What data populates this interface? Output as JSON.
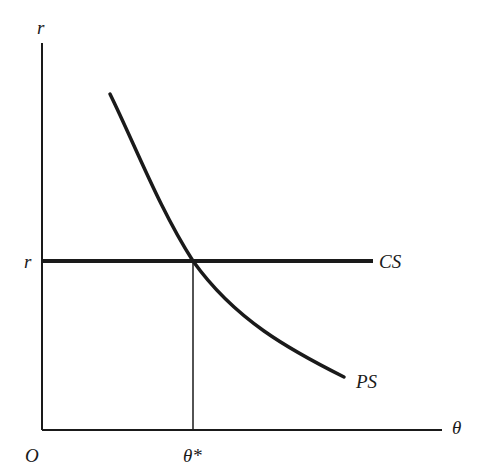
{
  "figure": {
    "type": "economics-diagram",
    "colors": {
      "ink": "#1a1a1a",
      "background": "#ffffff"
    },
    "axes": {
      "y_label": "r",
      "x_label": "θ",
      "origin_label": "O"
    },
    "levels": {
      "r_label": "r",
      "theta_star_label": "θ*"
    },
    "curves": [
      {
        "name": "CS",
        "label": "CS",
        "shape": "horizontal line at r"
      },
      {
        "name": "PS",
        "label": "PS",
        "shape": "downward-sloping convex curve"
      }
    ],
    "intersection": {
      "x_label": "θ*",
      "y_label": "r"
    }
  }
}
